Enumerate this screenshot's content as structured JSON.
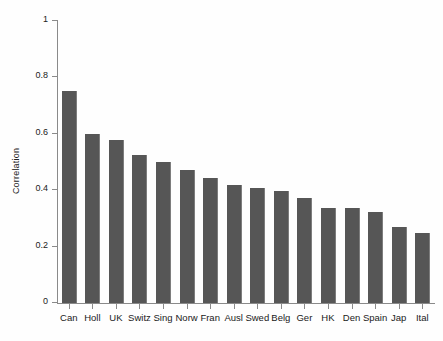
{
  "chart_data": {
    "type": "bar",
    "title": "",
    "subtitle": "",
    "xlabel": "",
    "ylabel": "Correlation",
    "ylim": [
      0,
      1
    ],
    "yticks": [
      "0",
      "0.2",
      "0.4",
      "0.6",
      "0.8",
      "1"
    ],
    "ytick_values": [
      0,
      0.2,
      0.4,
      0.6,
      0.8,
      1
    ],
    "grid": false,
    "legend": null,
    "bar_color": "#565656",
    "categories": [
      "Can",
      "Holl",
      "UK",
      "Switz",
      "Sing",
      "Norw",
      "Fran",
      "Ausl",
      "Swed",
      "Belg",
      "Ger",
      "HK",
      "Den",
      "Spain",
      "Jap",
      "Ital"
    ],
    "values": [
      0.752,
      0.6,
      0.577,
      0.524,
      0.5,
      0.473,
      0.445,
      0.417,
      0.407,
      0.397,
      0.373,
      0.336,
      0.336,
      0.322,
      0.27,
      0.248
    ],
    "annotations": []
  },
  "axes": {
    "y_label_text": "Correlation"
  }
}
